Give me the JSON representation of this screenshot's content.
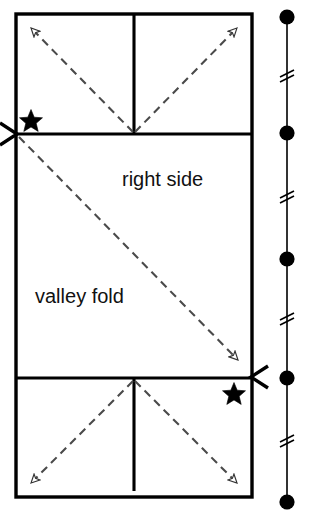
{
  "figure": {
    "background_color": "#ffffff",
    "ink_color": "#000000",
    "dash_color": "#555555",
    "labels": {
      "right_side": "right side",
      "valley_fold": "valley fold"
    },
    "caption": "",
    "paper": {
      "left": 16,
      "top": 14,
      "right": 252,
      "bottom": 497,
      "stroke_width": 3.2
    },
    "creases": {
      "upper_horizontal_y": 134,
      "lower_horizontal_y": 378,
      "center_vertical_x": 134,
      "upper_vertical_top": 14,
      "upper_vertical_bottom": 134,
      "lower_vertical_top": 378,
      "lower_vertical_bottom": 491
    },
    "stars": [
      {
        "name": "star-upper-left",
        "x": 31,
        "y": 120,
        "size": 17
      },
      {
        "name": "star-lower-right",
        "x": 234,
        "y": 393,
        "size": 17
      }
    ],
    "pinch_markers": [
      {
        "name": "pinch-marker-left",
        "x": 16,
        "y": 134,
        "direction": "right"
      },
      {
        "name": "pinch-marker-right",
        "x": 252,
        "y": 377,
        "direction": "left"
      }
    ],
    "fold_arrows": [
      {
        "name": "arrow-upper-left",
        "x1": 134,
        "y1": 133,
        "x2": 30,
        "y2": 27
      },
      {
        "name": "arrow-upper-right",
        "x1": 134,
        "y1": 133,
        "x2": 238,
        "y2": 27
      },
      {
        "name": "arrow-diagonal-valley",
        "x1": 18,
        "y1": 136,
        "x2": 239,
        "y2": 361
      },
      {
        "name": "arrow-lower-left",
        "x1": 134,
        "y1": 380,
        "x2": 30,
        "y2": 484
      },
      {
        "name": "arrow-lower-right",
        "x1": 134,
        "y1": 380,
        "x2": 238,
        "y2": 484
      }
    ],
    "side_view": {
      "name": "edge-on-side-view",
      "x": 287,
      "top": 17,
      "bottom": 502,
      "stroke_width": 2,
      "dots": [
        {
          "name": "layer-dot-1",
          "y": 17,
          "r": 7.5
        },
        {
          "name": "layer-dot-2",
          "y": 133,
          "r": 7.5
        },
        {
          "name": "layer-dot-3",
          "y": 259,
          "r": 7.5
        },
        {
          "name": "layer-dot-4",
          "y": 378,
          "r": 7.5
        },
        {
          "name": "layer-dot-5",
          "y": 502,
          "r": 7.5
        }
      ],
      "break_marks": [
        {
          "name": "break-mark-1",
          "y": 75
        },
        {
          "name": "break-mark-2",
          "y": 196
        },
        {
          "name": "break-mark-3",
          "y": 318
        },
        {
          "name": "break-mark-4",
          "y": 440
        }
      ]
    }
  }
}
